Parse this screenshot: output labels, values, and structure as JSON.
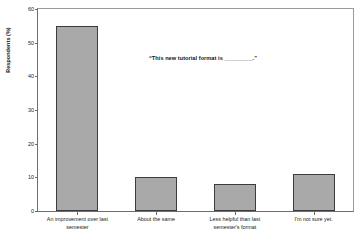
{
  "chart_data": {
    "type": "bar",
    "title": "",
    "subtitle": "",
    "xlabel": "",
    "ylabel": "Respondents (%)",
    "ylim": [
      0,
      60
    ],
    "ytick_values": [
      0,
      10,
      20,
      30,
      40,
      50,
      60
    ],
    "ytick_labels": [
      "0",
      "10",
      "20",
      "30",
      "40",
      "50",
      "60"
    ],
    "grid": false,
    "legend": null,
    "legend_position": "none",
    "annotation": {
      "prefix": "“This new tutorial format is ",
      "blank": "__________",
      "suffix": ".”",
      "full_text": "“This new tutorial format is __________.”"
    },
    "categories": [
      "An improvement over last semester",
      "About the same",
      "Less helpful than last semester's format",
      "I'm not sure yet."
    ],
    "category_lines": [
      [
        "An improvement over last",
        "semester"
      ],
      [
        "About the same",
        ""
      ],
      [
        "Less helpful than last",
        "semester's format"
      ],
      [
        "I'm not sure yet.",
        ""
      ]
    ],
    "values": [
      55,
      10,
      8,
      11
    ],
    "bar_fill_color": "#a9a9a9",
    "bar_edge_color": "#3c3c3c",
    "axis_color": "#6e6e6e",
    "background_color": "#ffffff"
  }
}
